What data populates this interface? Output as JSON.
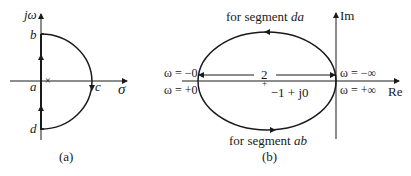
{
  "panel_a": {
    "caption": "(a)",
    "vertical_axis_label": "jω",
    "horizontal_axis_label": "σ",
    "points": {
      "b": "b",
      "a": "a",
      "c": "c",
      "d": "d"
    },
    "pole_marker": "×",
    "description": "Nyquist contour in s-plane: path d→a→b along jω axis, semicircle b→c→d"
  },
  "panel_b": {
    "caption": "(b)",
    "vertical_axis_label": "Im",
    "horizontal_axis_label": "Re",
    "top_segment_label_prefix": "for segment ",
    "top_segment_label_name": "da",
    "bottom_segment_label_prefix": "for segment ",
    "bottom_segment_label_name": "ab",
    "left_upper_label": "ω = −0",
    "left_lower_label": "ω = +0",
    "right_upper_label": "ω = −∞",
    "right_lower_label": "ω = +∞",
    "diameter_label": "2",
    "center_label": "−1 + j0",
    "center_marker": "+"
  },
  "colors": {
    "line": "#1a1a1a",
    "background": "#ffffff"
  }
}
